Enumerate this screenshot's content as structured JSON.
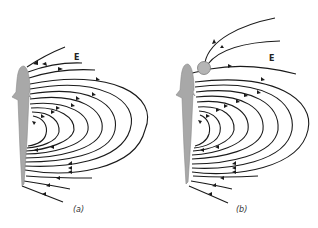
{
  "figure": {
    "colors": {
      "fish_fill": "#a8a8a8",
      "fish_stroke": "#8a8a8a",
      "field_line": "#1a1a1a",
      "object_fill": "#b5b5b5",
      "object_stroke": "#7a7a7a"
    },
    "panels": [
      {
        "id": "a",
        "caption": "(a)",
        "field_label": "E",
        "has_object": false
      },
      {
        "id": "b",
        "caption": "(b)",
        "field_label": "E",
        "has_object": true
      }
    ]
  }
}
